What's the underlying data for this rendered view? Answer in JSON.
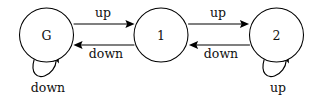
{
  "diagram": {
    "type": "state-transition-diagram",
    "title": "",
    "background_color": "#ffffff",
    "stroke_color": "#000000",
    "text_color": "#111111",
    "nodes": [
      {
        "id": "G",
        "label": "G",
        "cx": 46.5,
        "cy": 35,
        "r": 27
      },
      {
        "id": "1",
        "label": "1",
        "cx": 161,
        "cy": 35,
        "r": 27
      },
      {
        "id": "2",
        "label": "2",
        "cx": 276.5,
        "cy": 35,
        "r": 27
      }
    ],
    "edges": [
      {
        "id": "g-to-1",
        "from": "G",
        "to": "1",
        "label": "up",
        "direction": "right",
        "label_x": 103,
        "label_y": 17,
        "y": 24
      },
      {
        "id": "1-to-g",
        "from": "1",
        "to": "G",
        "label": "down",
        "direction": "left",
        "label_x": 106,
        "label_y": 58,
        "y": 45
      },
      {
        "id": "1-to-2",
        "from": "1",
        "to": "2",
        "label": "up",
        "direction": "right",
        "label_x": 218,
        "label_y": 17,
        "y": 24
      },
      {
        "id": "2-to-1",
        "from": "2",
        "to": "1",
        "label": "down",
        "direction": "left",
        "label_x": 221,
        "label_y": 58,
        "y": 45
      }
    ],
    "self_loops": [
      {
        "id": "g-self-loop",
        "node": "G",
        "label": "down",
        "label_x": 48,
        "label_y": 89,
        "position": "below"
      },
      {
        "id": "2-self-loop",
        "node": "2",
        "label": "up",
        "label_x": 278,
        "label_y": 89,
        "position": "below"
      }
    ]
  }
}
